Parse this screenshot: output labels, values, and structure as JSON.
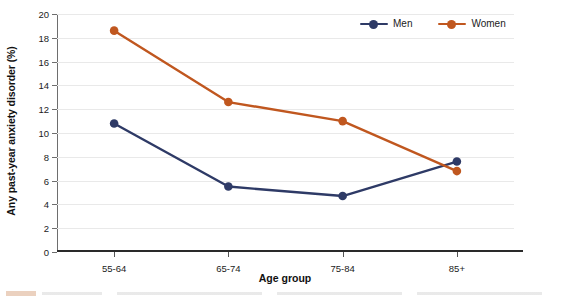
{
  "chart_data": {
    "type": "line",
    "title": "",
    "xlabel": "Age group",
    "ylabel": "Any past-year anxiety disorder (%)",
    "categories": [
      "55-64",
      "65-74",
      "75-84",
      "85+"
    ],
    "ylim": [
      0,
      20
    ],
    "ytick_step": 2,
    "yticks": [
      0,
      2,
      4,
      6,
      8,
      10,
      12,
      14,
      16,
      18,
      20
    ],
    "ytick_labels": [
      "0",
      "2",
      "4",
      "6",
      "8",
      "10",
      "12",
      "14",
      "16",
      "18",
      "20"
    ],
    "grid": true,
    "grid_axis": "y",
    "legend_position": "top-right",
    "markers": "circle",
    "series": [
      {
        "name": "Men",
        "color": "#2e3a66",
        "values": [
          10.8,
          5.5,
          4.7,
          7.6
        ]
      },
      {
        "name": "Women",
        "color": "#c0571f",
        "values": [
          18.6,
          12.6,
          11.0,
          6.8
        ]
      }
    ]
  },
  "legend": {
    "entries": [
      {
        "label": "Men",
        "color": "#2e3a66"
      },
      {
        "label": "Women",
        "color": "#c0571f"
      }
    ]
  },
  "axes": {
    "y_title": "Any past-year anxiety disorder (%)",
    "x_title": "Age group"
  }
}
